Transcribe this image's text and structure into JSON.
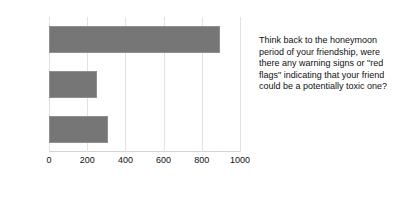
{
  "chart_data": {
    "type": "bar",
    "orientation": "horizontal",
    "title": "",
    "xlabel": "",
    "ylabel": "",
    "categories": [
      "Yes",
      "No",
      "Not Sure"
    ],
    "values": [
      895,
      250,
      310
    ],
    "xlim": [
      0,
      1000
    ],
    "xticks": [
      0,
      200,
      400,
      600,
      800,
      1000
    ],
    "xtick_labels": [
      "0",
      "200",
      "400",
      "600",
      "800",
      "1000"
    ],
    "grid": true,
    "grid_axis": "x",
    "legend": false,
    "bar_color": "#767676",
    "grid_color": "#e2e2e2",
    "axis_color": "#d5d5d5"
  },
  "annotation": {
    "question": "Think back to the honeymoon period of your friendship, were there any warning signs or \"red flags\" indicating that your friend could be a potentially toxic one?"
  }
}
